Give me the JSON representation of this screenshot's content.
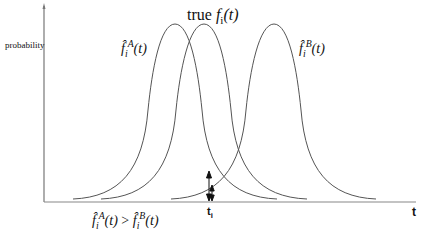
{
  "diagram": {
    "y_axis_label": "probability",
    "x_axis_label": "t",
    "marker_label": "t",
    "marker_subscript": "i",
    "curves": [
      {
        "id": "A",
        "label_base": "f̂",
        "label_sub": "i",
        "label_sup": "A",
        "label_arg": "(t)",
        "peak_x": 175
      },
      {
        "id": "true",
        "label_prefix": "true",
        "label_base": "f",
        "label_sub": "i",
        "label_arg": "(t)",
        "peak_x": 204
      },
      {
        "id": "B",
        "label_base": "f̂",
        "label_sub": "i",
        "label_sup": "B",
        "label_arg": "(t)",
        "peak_x": 274
      }
    ],
    "inequality": {
      "left_base": "f̂",
      "left_sub": "i",
      "left_sup": "A",
      "left_arg": "(t)",
      "op": ">",
      "right_base": "f̂",
      "right_sub": "i",
      "right_sup": "B",
      "right_arg": "(t)"
    },
    "colors": {
      "line": "#555555",
      "axis": "#777777",
      "arrow": "#111111",
      "text": "#111111"
    }
  }
}
